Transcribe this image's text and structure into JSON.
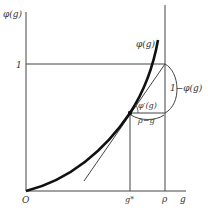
{
  "diagram": {
    "y_axis_label": "φ(g)",
    "y_tick_one": "1",
    "curve_label": "φ(g)",
    "slope_label": "φ′(g)",
    "right_brace_label": "1−φ(g)",
    "horizontal_brace_label": "ρ−g",
    "origin_label": "O",
    "x_tick_gstar": "g*",
    "x_tick_rho": "ρ",
    "x_axis_label": "g",
    "colors": {
      "curve": "#111111",
      "lines": "#444444",
      "background": "#ffffff"
    }
  }
}
